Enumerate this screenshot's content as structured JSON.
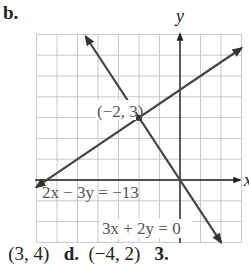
{
  "part_label": "b.",
  "chart_data": {
    "type": "line",
    "title": "",
    "xlabel": "x",
    "ylabel": "y",
    "xlim": [
      -7,
      3
    ],
    "ylim": [
      -3,
      7
    ],
    "grid": true,
    "grid_step": 1,
    "series": [
      {
        "name": "2x − 3y = −13",
        "equation": "2x - 3y = -13",
        "x": [
          -7,
          3
        ],
        "y": [
          -0.333,
          6.333
        ],
        "arrows": "both"
      },
      {
        "name": "3x + 2y = 0",
        "equation": "3x + 2y = 0",
        "x": [
          -4.6,
          2
        ],
        "y": [
          6.9,
          -3
        ],
        "arrows": "both"
      }
    ],
    "annotations": [
      {
        "text": "(−2, 3)",
        "x": -2,
        "y": 3,
        "type": "intersection-point"
      }
    ],
    "labels": {
      "line1": "2x − 3y = −13",
      "line2": "3x + 2y = 0",
      "point": "(−2, 3)",
      "y_axis": "y",
      "x_axis": "x"
    }
  },
  "bottom_text": {
    "c_prefix": "",
    "c_value": "(3, 4)",
    "d_label": "d.",
    "d_value": "(−4, 2)",
    "next_label": "3."
  }
}
